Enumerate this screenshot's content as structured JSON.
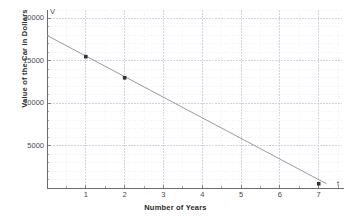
{
  "chart_data": {
    "type": "line",
    "title": "",
    "xlabel": "Number of Years",
    "ylabel": "Value of the Car in Dollars",
    "x_axis_name": "t",
    "y_axis_name": "V",
    "xlim": [
      0,
      7.6
    ],
    "ylim": [
      0,
      21000
    ],
    "grid": true,
    "legend": "none",
    "x_major_ticks": [
      1,
      2,
      3,
      4,
      5,
      6,
      7
    ],
    "x_tick_labels": [
      "1",
      "2",
      "3",
      "4",
      "5",
      "6",
      "7"
    ],
    "y_major_ticks": [
      5000,
      10000,
      15000,
      20000
    ],
    "y_tick_labels": [
      "5000",
      "10000",
      "15000",
      "20000"
    ],
    "x_minor_step": 0.5,
    "y_minor_step": 1000,
    "series": [
      {
        "name": "Value of the Car",
        "type": "line",
        "color": "#9a9a9a",
        "x": [
          0,
          7.2
        ],
        "values": [
          18000,
          500
        ]
      }
    ],
    "points": [
      {
        "label": "(1, 15500)",
        "x": 1,
        "y": 15500
      },
      {
        "label": "(2, 13000)",
        "x": 2,
        "y": 13000
      },
      {
        "label": "(7, 500)",
        "x": 7,
        "y": 500
      }
    ],
    "point_color": "#333333",
    "grid_major_color": "#b9c4d6",
    "grid_minor_color": "#dfe6ef",
    "axis_color": "#6b6b6b"
  }
}
